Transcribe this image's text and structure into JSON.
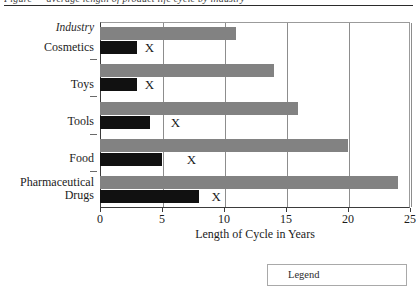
{
  "caption": {
    "cut_off_text": "Figure — average length of product life cycle by industry"
  },
  "chart_data": {
    "type": "bar",
    "orientation": "horizontal",
    "title": "",
    "subtitle": "",
    "category_axis_title": "Industry",
    "xlabel": "Length of Cycle in Years",
    "ylabel": "",
    "xlim": [
      0,
      25
    ],
    "xticks": [
      0,
      5,
      10,
      15,
      20,
      25
    ],
    "xtick_labels": [
      "0",
      "5",
      "10",
      "15",
      "20",
      "25"
    ],
    "grid": true,
    "grid_axis": "x",
    "legend_position": "below-right",
    "categories": [
      "Cosmetics",
      "Toys",
      "Tools",
      "Food",
      "Pharmaceutical Drugs"
    ],
    "category_label_lines": [
      [
        "Cosmetics"
      ],
      [
        "Toys"
      ],
      [
        "Tools"
      ],
      [
        "Food"
      ],
      [
        "Pharmaceutical",
        "Drugs"
      ]
    ],
    "series": [
      {
        "name": "",
        "color": "#828282",
        "values": [
          11,
          14,
          16,
          20,
          24
        ]
      },
      {
        "name": "",
        "color": "#111111",
        "values": [
          3,
          3,
          4,
          5,
          8
        ]
      }
    ],
    "annotations": [
      {
        "label": "X",
        "category": "Cosmetics",
        "x": 3.6
      },
      {
        "label": "X",
        "category": "Toys",
        "x": 3.6
      },
      {
        "label": "X",
        "category": "Tools",
        "x": 5.7
      },
      {
        "label": "X",
        "category": "Food",
        "x": 7.0
      },
      {
        "label": "X",
        "category": "Pharmaceutical Drugs",
        "x": 9.0
      }
    ]
  },
  "legend": {
    "label": "Legend",
    "entries": []
  }
}
